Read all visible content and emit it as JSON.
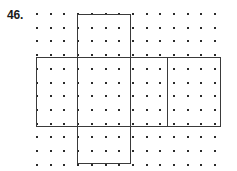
{
  "problem": {
    "number_label": "46."
  },
  "figure": {
    "grid": {
      "columns": 14,
      "rows": 12,
      "spacing_px": 13.7,
      "origin_x": 36,
      "origin_y": 13,
      "dot_color": "#2b2b2b",
      "dot_size_px": 2
    },
    "line_color": "#3a3a3a",
    "line_width_px": 1.4,
    "background_color": "#ffffff",
    "segments": [
      {
        "name": "top-flap-top-edge",
        "orientation": "h",
        "x": 77,
        "y": 14,
        "length": 54
      },
      {
        "name": "top-flap-left-edge",
        "orientation": "v",
        "x": 77,
        "y": 14,
        "length": 43
      },
      {
        "name": "top-flap-right-edge",
        "orientation": "v",
        "x": 130,
        "y": 14,
        "length": 43
      },
      {
        "name": "band-top-edge",
        "orientation": "h",
        "x": 36,
        "y": 57,
        "length": 185
      },
      {
        "name": "band-bottom-edge",
        "orientation": "h",
        "x": 36,
        "y": 126,
        "length": 185
      },
      {
        "name": "band-left-edge",
        "orientation": "v",
        "x": 36,
        "y": 57,
        "length": 70
      },
      {
        "name": "band-right-edge",
        "orientation": "v",
        "x": 220,
        "y": 57,
        "length": 70
      },
      {
        "name": "band-divider-1",
        "orientation": "v",
        "x": 77,
        "y": 57,
        "length": 70
      },
      {
        "name": "band-divider-2",
        "orientation": "v",
        "x": 130,
        "y": 57,
        "length": 70
      },
      {
        "name": "band-divider-3",
        "orientation": "v",
        "x": 167,
        "y": 57,
        "length": 70
      },
      {
        "name": "bottom-flap-left-edge",
        "orientation": "v",
        "x": 77,
        "y": 126,
        "length": 38
      },
      {
        "name": "bottom-flap-right-edge",
        "orientation": "v",
        "x": 130,
        "y": 126,
        "length": 38
      },
      {
        "name": "bottom-flap-bottom-edge",
        "orientation": "h",
        "x": 77,
        "y": 163,
        "length": 54
      }
    ]
  }
}
